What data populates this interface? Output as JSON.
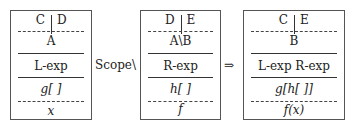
{
  "diagram": {
    "operator_between_1_2": "Scope\\",
    "operator_between_2_3": "⇒",
    "boxes": [
      {
        "id": "left-box",
        "top_left": "C",
        "top_right": "D",
        "type": "A",
        "expression": "L-exp",
        "context": "g[ ]",
        "term": "x"
      },
      {
        "id": "middle-box",
        "top_left": "D",
        "top_right": "E",
        "type": "A\\B",
        "expression": "R-exp",
        "context": "h[ ]",
        "term": "f"
      },
      {
        "id": "result-box",
        "top_left": "C",
        "top_right": "E",
        "type": "B",
        "expression": "L-exp R-exp",
        "context": "g[h[ ]]",
        "term": "f(x)"
      }
    ]
  }
}
